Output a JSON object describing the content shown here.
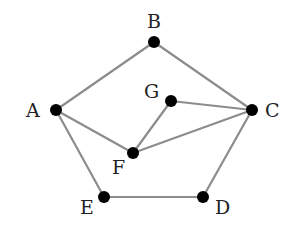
{
  "diagram": {
    "type": "graph",
    "edge_color": "#8c8c8c",
    "node_color": "#000000",
    "nodes": [
      {
        "id": "A",
        "label": "A",
        "x": 56,
        "y": 110,
        "label_x": 26,
        "label_y": 117
      },
      {
        "id": "B",
        "label": "B",
        "x": 154,
        "y": 42,
        "label_x": 147,
        "label_y": 28
      },
      {
        "id": "C",
        "label": "C",
        "x": 252,
        "y": 110,
        "label_x": 265,
        "label_y": 117
      },
      {
        "id": "D",
        "label": "D",
        "x": 203,
        "y": 197,
        "label_x": 215,
        "label_y": 214
      },
      {
        "id": "E",
        "label": "E",
        "x": 104,
        "y": 197,
        "label_x": 80,
        "label_y": 214
      },
      {
        "id": "F",
        "label": "F",
        "x": 133,
        "y": 153,
        "label_x": 112,
        "label_y": 174
      },
      {
        "id": "G",
        "label": "G",
        "x": 171,
        "y": 101,
        "label_x": 144,
        "label_y": 98
      }
    ],
    "edges": [
      {
        "from": "A",
        "to": "B"
      },
      {
        "from": "B",
        "to": "C"
      },
      {
        "from": "A",
        "to": "F"
      },
      {
        "from": "A",
        "to": "E"
      },
      {
        "from": "E",
        "to": "D"
      },
      {
        "from": "D",
        "to": "C"
      },
      {
        "from": "G",
        "to": "C"
      },
      {
        "from": "G",
        "to": "F"
      },
      {
        "from": "F",
        "to": "C"
      }
    ]
  }
}
